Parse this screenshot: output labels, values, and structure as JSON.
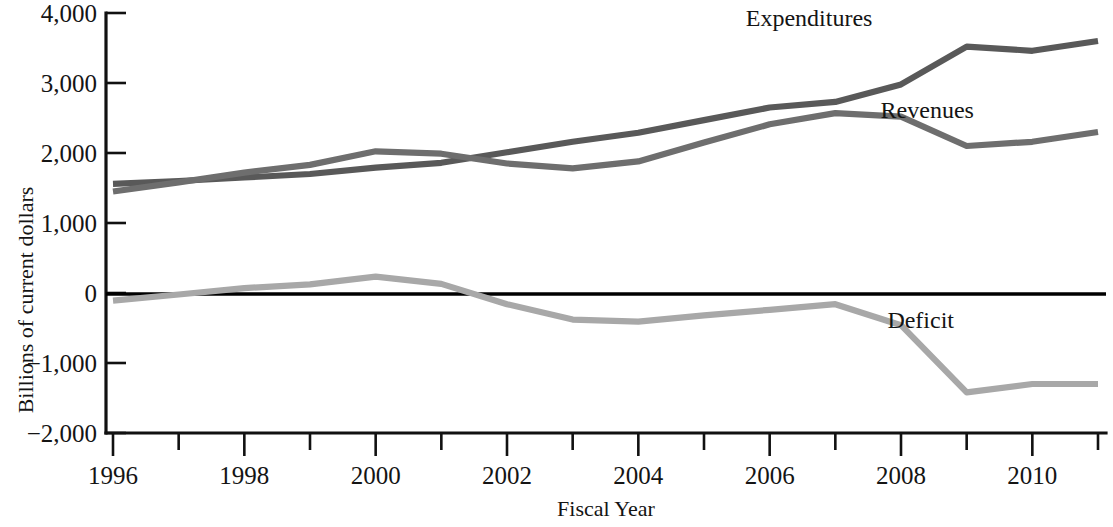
{
  "chart_data": {
    "type": "line",
    "title": "",
    "xlabel": "Fiscal Year",
    "ylabel": "Billions of current dollars",
    "x": [
      1996,
      1997,
      1998,
      1999,
      2000,
      2001,
      2002,
      2003,
      2004,
      2005,
      2006,
      2007,
      2008,
      2009,
      2010,
      2011
    ],
    "xlim": [
      1996,
      2011
    ],
    "ylim": [
      -2000,
      4000
    ],
    "xticks": [
      1996,
      1997,
      1998,
      1999,
      2000,
      2001,
      2002,
      2003,
      2004,
      2005,
      2006,
      2007,
      2008,
      2009,
      2010,
      2011
    ],
    "xtick_labels": [
      "1996",
      "",
      "1998",
      "",
      "2000",
      "",
      "2002",
      "",
      "2004",
      "",
      "2006",
      "",
      "2008",
      "",
      "2010",
      ""
    ],
    "yticks": [
      4000,
      3000,
      2000,
      1000,
      0,
      -1000,
      -2000
    ],
    "ytick_labels": [
      "4,000",
      "3,000",
      "2,000",
      "1,000",
      "0",
      "−1,000",
      "−2,000"
    ],
    "grid": false,
    "legend_position": "inline-annotations",
    "series": [
      {
        "name": "Expenditures",
        "color": "#595959",
        "values": [
          1560,
          1600,
          1650,
          1700,
          1790,
          1860,
          2010,
          2160,
          2290,
          2470,
          2650,
          2730,
          2980,
          3520,
          3460,
          3600
        ]
      },
      {
        "name": "Revenues",
        "color": "#6e6e6e",
        "values": [
          1450,
          1580,
          1720,
          1830,
          2025,
          1990,
          1850,
          1780,
          1880,
          2150,
          2410,
          2570,
          2520,
          2100,
          2160,
          2300
        ]
      },
      {
        "name": "Deficit",
        "color": "#a8a8a8",
        "values": [
          -110,
          -22,
          70,
          125,
          235,
          130,
          -160,
          -380,
          -410,
          -320,
          -240,
          -160,
          -460,
          -1420,
          -1300,
          -1300
        ]
      }
    ]
  },
  "annotations": [
    {
      "label": "Expenditures",
      "x": 2006.6,
      "y": 3820
    },
    {
      "label": "Revenues",
      "x": 2008.4,
      "y": 2500
    },
    {
      "label": "Deficit",
      "x": 2008.3,
      "y": -500
    }
  ]
}
